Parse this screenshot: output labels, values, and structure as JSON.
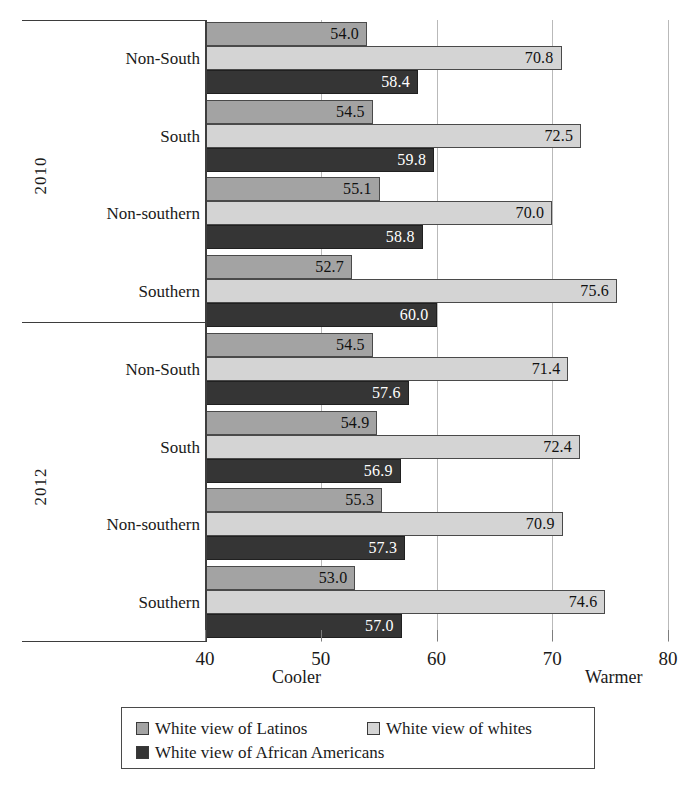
{
  "chart_data": {
    "type": "bar",
    "orientation": "horizontal",
    "title": "",
    "xlabel": "",
    "ylabel": "",
    "xlim": [
      40,
      80
    ],
    "xticks": [
      40,
      50,
      60,
      70,
      80
    ],
    "grid": true,
    "legend_position": "bottom",
    "axis_anchor_low": "Cooler",
    "axis_anchor_high": "Warmer",
    "series": [
      {
        "name": "White view of Latinos",
        "color": "#a3a3a3"
      },
      {
        "name": "White view of whites",
        "color": "#d4d4d4"
      },
      {
        "name": "White view of African Americans",
        "color": "#353535"
      }
    ],
    "groups": [
      {
        "year": "2010",
        "categories": [
          {
            "label": "Non-South",
            "values": [
              54.0,
              70.8,
              58.4
            ]
          },
          {
            "label": "South",
            "values": [
              54.5,
              72.5,
              59.8
            ]
          },
          {
            "label": "Non-southern",
            "values": [
              55.1,
              70.0,
              58.8
            ]
          },
          {
            "label": "Southern",
            "values": [
              52.7,
              75.6,
              60.0
            ]
          }
        ]
      },
      {
        "year": "2012",
        "categories": [
          {
            "label": "Non-South",
            "values": [
              54.5,
              71.4,
              57.6
            ]
          },
          {
            "label": "South",
            "values": [
              54.9,
              72.4,
              56.9
            ]
          },
          {
            "label": "Non-southern",
            "values": [
              55.3,
              70.9,
              57.3
            ]
          },
          {
            "label": "Southern",
            "values": [
              53.0,
              74.6,
              57.0
            ]
          }
        ]
      }
    ]
  },
  "axis": {
    "tick_labels": [
      "40",
      "50",
      "60",
      "70",
      "80"
    ]
  },
  "legend": {
    "items": [
      {
        "label": "White view of Latinos"
      },
      {
        "label": "White view of whites"
      },
      {
        "label": "White view of African Americans"
      }
    ]
  },
  "labels": {
    "cooler": "Cooler",
    "warmer": "Warmer"
  },
  "years": [
    "2010",
    "2012"
  ]
}
